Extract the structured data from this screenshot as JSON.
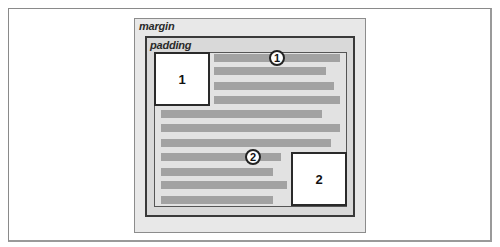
{
  "diagram": {
    "labels": {
      "margin": "margin",
      "padding": "padding"
    },
    "floats": [
      {
        "id": "1",
        "label": "1"
      },
      {
        "id": "2",
        "label": "2"
      }
    ],
    "markers": [
      {
        "id": "1",
        "label": "1"
      },
      {
        "id": "2",
        "label": "2"
      }
    ],
    "text_lines": [
      {
        "row": 1,
        "x": 214,
        "y": 54,
        "width": 126
      },
      {
        "row": 2,
        "x": 214,
        "y": 67,
        "width": 112
      },
      {
        "row": 3,
        "x": 214,
        "y": 82,
        "width": 120
      },
      {
        "row": 4,
        "x": 214,
        "y": 96,
        "width": 126
      },
      {
        "row": 5,
        "x": 161,
        "y": 110,
        "width": 161
      },
      {
        "row": 6,
        "x": 161,
        "y": 124,
        "width": 179
      },
      {
        "row": 7,
        "x": 161,
        "y": 139,
        "width": 170
      },
      {
        "row": 8,
        "x": 161,
        "y": 153,
        "width": 120
      },
      {
        "row": 9,
        "x": 161,
        "y": 168,
        "width": 112
      },
      {
        "row": 10,
        "x": 161,
        "y": 181,
        "width": 126
      },
      {
        "row": 11,
        "x": 161,
        "y": 196,
        "width": 112
      }
    ],
    "colors": {
      "margin_fill": "#e8e8e8",
      "padding_fill": "#d9d9d9",
      "content_fill": "#e2e2e2",
      "text_line": "#a2a2a2",
      "border": "#3a3a3a"
    }
  }
}
